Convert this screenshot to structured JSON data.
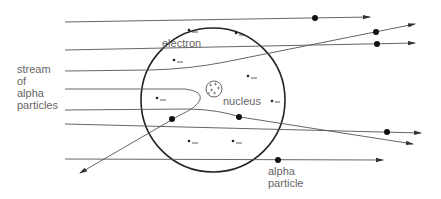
{
  "diagram": {
    "labels": {
      "electron": "electron",
      "nucleus": "nucleus",
      "stream_line1": "stream",
      "stream_line2": "of",
      "stream_line3": "alpha",
      "stream_line4": "particles",
      "alpha_line1": "alpha",
      "alpha_line2": "particle"
    },
    "atom": {
      "cx": 213,
      "cy": 100,
      "r": 72
    },
    "nucleus": {
      "cx": 214,
      "cy": 89,
      "r": 8
    },
    "electrons": [
      {
        "x": 189,
        "y": 30
      },
      {
        "x": 236,
        "y": 33
      },
      {
        "x": 174,
        "y": 60
      },
      {
        "x": 248,
        "y": 76
      },
      {
        "x": 157,
        "y": 99
      },
      {
        "x": 272,
        "y": 101
      },
      {
        "x": 189,
        "y": 141
      },
      {
        "x": 233,
        "y": 141
      }
    ],
    "trajectories": [
      {
        "name": "top-straight",
        "path": "M65,22 L370,17",
        "alpha": [
          315,
          18
        ]
      },
      {
        "name": "deflected-up",
        "path": "M65,50 L250,47 Q280,46 300,42 L415,23",
        "alpha": [
          376,
          32
        ]
      },
      {
        "name": "slight-deflect-upper",
        "path": "M65,71 L205,70 Q240,68 300,53 L380,37",
        "alpha": null
      },
      {
        "name": "through-upper",
        "path": "M65,50 L415,43",
        "alpha": [
          377,
          44
        ]
      },
      {
        "name": "back-scattered",
        "path": "M65,89 L185,89 Q205,92 198,100 Q192,108 180,115 L82,173",
        "alpha": [
          172,
          119
        ]
      },
      {
        "name": "deflected-down",
        "path": "M65,110 L190,109 Q225,110 240,117 L413,143",
        "alpha": [
          240,
          118
        ]
      },
      {
        "name": "through-lower",
        "path": "M65,124 L420,133",
        "alpha": [
          387,
          132
        ]
      },
      {
        "name": "bottom-straight",
        "path": "M65,159 L383,160",
        "alpha": [
          278,
          160
        ]
      }
    ]
  }
}
